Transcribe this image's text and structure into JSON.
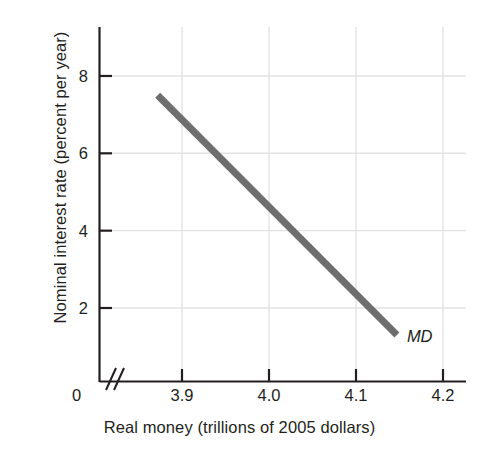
{
  "chart_data": {
    "type": "line",
    "title": "",
    "xlabel": "Real money (trillions of 2005 dollars)",
    "ylabel": "Nominal interest rate (percent per year)",
    "origin_label": "0",
    "xticks": [
      "3.9",
      "4.0",
      "4.1",
      "4.2"
    ],
    "xtick_values": [
      3.9,
      4.0,
      4.1,
      4.2
    ],
    "yticks": [
      "8",
      "6",
      "4",
      "2"
    ],
    "ytick_values": [
      8,
      6,
      4,
      2
    ],
    "xlim": [
      3.83,
      4.22
    ],
    "ylim": [
      0,
      9.2
    ],
    "axis_break": true,
    "axis_break_symbol": "//",
    "grid": true,
    "legend_position": "inline-right-end",
    "series": [
      {
        "name": "MD",
        "label": "MD",
        "label_style": "italic",
        "color": "#6e6e6e",
        "linewidth": 7,
        "x": [
          3.872,
          4.147
        ],
        "y": [
          7.5,
          1.3
        ],
        "points": [
          {
            "x": 3.872,
            "y": 7.5
          },
          {
            "x": 3.9,
            "y": 6.87
          },
          {
            "x": 4.0,
            "y": 4.62
          },
          {
            "x": 4.1,
            "y": 2.37
          },
          {
            "x": 4.147,
            "y": 1.3
          }
        ]
      }
    ],
    "colors": {
      "curve": "#6e6e6e",
      "axis": "#231f20",
      "grid": "#e3e3e3",
      "text": "#231f20",
      "background": "#ffffff"
    }
  }
}
